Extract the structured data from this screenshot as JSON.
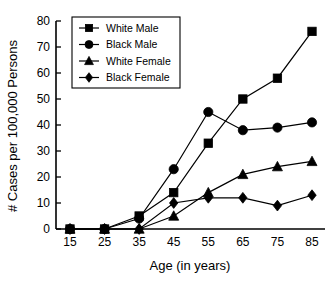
{
  "chart_data": {
    "type": "line",
    "title": "",
    "xlabel": "Age (in years)",
    "ylabel": "# Cases per 100,000 Persons",
    "categories": [
      15,
      25,
      35,
      45,
      55,
      65,
      75,
      85
    ],
    "x_tick_labels": [
      "15",
      "25",
      "35",
      "45",
      "55",
      "65",
      "75",
      "85"
    ],
    "y_tick_labels": [
      "0",
      "10",
      "20",
      "30",
      "40",
      "50",
      "60",
      "70",
      "80"
    ],
    "y_ticks": [
      0,
      10,
      20,
      30,
      40,
      50,
      60,
      70,
      80
    ],
    "ylim": [
      0,
      80
    ],
    "xlim": [
      15,
      85
    ],
    "grid": false,
    "legend_position": "top-left",
    "series": [
      {
        "name": "White Male",
        "marker": "square",
        "values": [
          0,
          0,
          5,
          14,
          33,
          50,
          58,
          76
        ]
      },
      {
        "name": "Black Male",
        "marker": "circle",
        "values": [
          0,
          0,
          4,
          23,
          45,
          38,
          39,
          41
        ]
      },
      {
        "name": "White Female",
        "marker": "triangle",
        "values": [
          0,
          0,
          0,
          5,
          14,
          21,
          24,
          26
        ]
      },
      {
        "name": "Black Female",
        "marker": "diamond",
        "values": [
          0,
          0,
          0,
          10,
          12,
          12,
          9,
          13
        ]
      }
    ]
  },
  "colors": {
    "ink": "#000000",
    "background": "#ffffff"
  }
}
